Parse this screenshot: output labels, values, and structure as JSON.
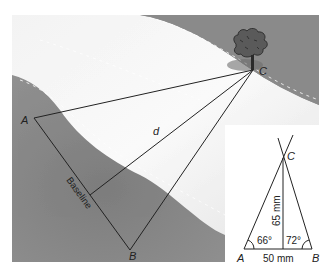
{
  "figure": {
    "type": "triangulation-diagram",
    "colors": {
      "land": "#8e8e8e",
      "river": "#eeeeee",
      "line": "#222222",
      "inset_bg": "#ffffff"
    },
    "main": {
      "points": {
        "A": {
          "label": "A"
        },
        "B": {
          "label": "B"
        },
        "C": {
          "label": "C"
        }
      },
      "distance_label": "d",
      "baseline_label": "Baseline",
      "landmark": "tree"
    },
    "inset": {
      "points": {
        "A": {
          "label": "A"
        },
        "B": {
          "label": "B"
        },
        "C": {
          "label": "C"
        }
      },
      "angle_A": "66°",
      "angle_B": "72°",
      "base_length": "50 mm",
      "height_length": "65 mm"
    }
  }
}
